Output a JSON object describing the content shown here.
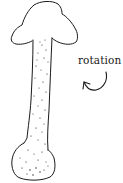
{
  "diagram": {
    "annotation": {
      "label": "rotation",
      "arrow": "curved-arrow-counterclockwise"
    },
    "colors": {
      "ink": "#1a1a1a",
      "background": "#ffffff"
    }
  }
}
